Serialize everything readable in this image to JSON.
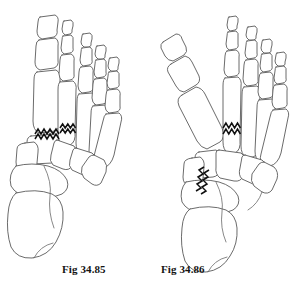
{
  "plate": {
    "name": "foot-osteotomy-figure-plate",
    "background_color": "#ffffff",
    "line_color": "#5a5a5a",
    "fracture_color": "#111111"
  },
  "figures": [
    {
      "id": "fig-left",
      "caption": "Fig 34.85",
      "view": "dorsal view of skeleton of right foot",
      "osteotomy_marks": 2,
      "osteotomy_description": "zigzag osteotomy line at first metatarsal base and zigzag osteotomy line across second metatarsal shaft"
    },
    {
      "id": "fig-right",
      "caption": "Fig 34.86",
      "view": "dorsal view of skeleton of right foot with hallux abducted",
      "osteotomy_marks": 2,
      "osteotomy_description": "zigzag osteotomy line across second metatarsal shaft and oblique zigzag osteotomy line through medial cuneiform-navicular region"
    }
  ],
  "captions": {
    "left": "Fig 34.85",
    "right": "Fig 34.86"
  }
}
